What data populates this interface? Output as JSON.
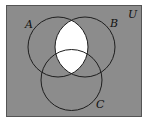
{
  "diagram": {
    "type": "venn-3",
    "universe_label": "U",
    "sets": [
      {
        "name": "A",
        "label": "A"
      },
      {
        "name": "B",
        "label": "B"
      },
      {
        "name": "C",
        "label": "C"
      }
    ],
    "shaded_region_description": "Everything shaded except A ∩ B",
    "unshaded_regions": [
      "A∩B∩C'",
      "A∩B∩C"
    ],
    "colors": {
      "shade": "#8c8c8c",
      "unshaded": "#ffffff",
      "outline": "#1e1e1e"
    }
  }
}
